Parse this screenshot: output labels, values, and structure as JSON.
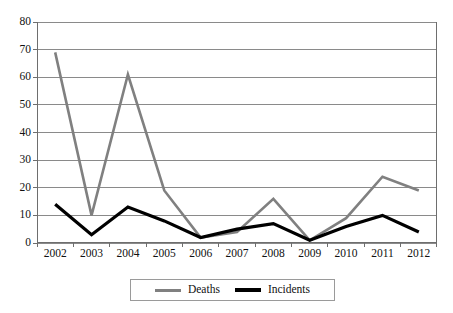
{
  "chart_data": {
    "type": "line",
    "title": "",
    "subtitle": "",
    "xlabel": "",
    "ylabel": "",
    "categories": [
      "2002",
      "2003",
      "2004",
      "2005",
      "2006",
      "2007",
      "2008",
      "2009",
      "2010",
      "2011",
      "2012"
    ],
    "series": [
      {
        "name": "Deaths",
        "color": "#808080",
        "values": [
          69,
          10,
          61,
          19,
          2,
          4,
          16,
          1,
          9,
          24,
          19
        ]
      },
      {
        "name": "Incidents",
        "color": "#000000",
        "values": [
          14,
          3,
          13,
          8,
          2,
          5,
          7,
          1,
          6,
          10,
          4
        ]
      }
    ],
    "ylim": [
      0,
      80
    ],
    "ytick_values": [
      0,
      10,
      20,
      30,
      40,
      50,
      60,
      70,
      80
    ],
    "ytick_labels": [
      "0",
      "10",
      "20",
      "30",
      "40",
      "50",
      "60",
      "70",
      "80"
    ],
    "grid": true,
    "grid_axis": "y",
    "legend_position": "bottom",
    "axis_color": "#6e6e6e",
    "grid_color": "#8a8a8a",
    "background": "#ffffff"
  },
  "legend": {
    "entries": [
      {
        "label": "Deaths",
        "color": "#808080",
        "swatch": "line-swatch-gray"
      },
      {
        "label": "Incidents",
        "color": "#000000",
        "swatch": "line-swatch-black"
      }
    ]
  }
}
